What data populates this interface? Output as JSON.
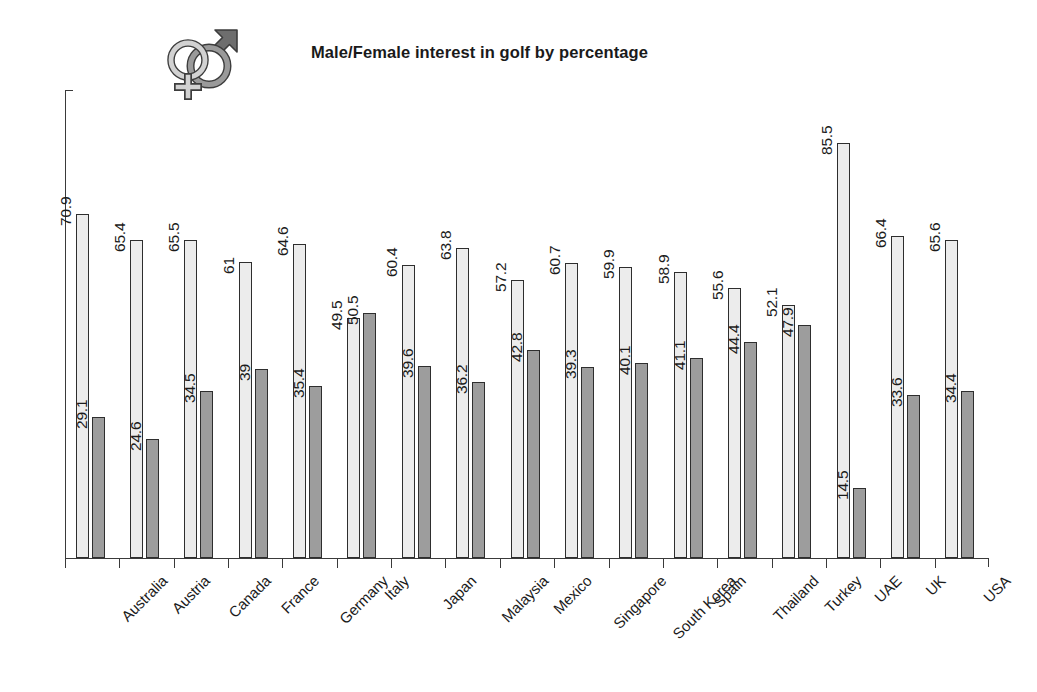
{
  "header": {
    "title": "Male/Female interest in golf by percentage",
    "icon": "male-female-gender-symbol-icon"
  },
  "chart_data": {
    "type": "bar",
    "title": "Male/Female interest in golf by percentage",
    "xlabel": "",
    "ylabel": "",
    "ylim": [
      0,
      90
    ],
    "grid": false,
    "legend": "none",
    "axis_tick_labels_y": [],
    "categories": [
      "Australia",
      "Austria",
      "Canada",
      "France",
      "Germany",
      "Italy",
      "Japan",
      "Malaysia",
      "Mexico",
      "Singapore",
      "South Korea",
      "Spain",
      "Thailand",
      "Turkey",
      "UAE",
      "UK",
      "USA"
    ],
    "series": [
      {
        "name": "Male",
        "color": "#ececec",
        "values": [
          70.9,
          65.4,
          65.5,
          61,
          64.6,
          49.5,
          60.4,
          63.8,
          57.2,
          60.7,
          59.9,
          58.9,
          55.6,
          52.1,
          85.5,
          66.4,
          65.6
        ],
        "labels": [
          "70.9",
          "65.4",
          "65.5",
          "61",
          "64.6",
          "49.5",
          "60.4",
          "63.8",
          "57.2",
          "60.7",
          "59.9",
          "58.9",
          "55.6",
          "52.1",
          "85.5",
          "66.4",
          "65.6"
        ]
      },
      {
        "name": "Female",
        "color": "#9d9d9d",
        "values": [
          29.1,
          24.6,
          34.5,
          39,
          35.4,
          50.5,
          39.6,
          36.2,
          42.8,
          39.3,
          40.1,
          41.1,
          44.4,
          47.9,
          14.5,
          33.6,
          34.4
        ],
        "labels": [
          "29.1",
          "24.6",
          "34.5",
          "39",
          "35.4",
          "50.5",
          "39.6",
          "36.2",
          "42.8",
          "39.3",
          "40.1",
          "41.1",
          "44.4",
          "47.9",
          "14.5",
          "33.6",
          "34.4"
        ]
      }
    ]
  },
  "colors": {
    "male_bar": "#ececec",
    "female_bar": "#9d9d9d",
    "bar_outline": "#2e2e2e",
    "axis": "#3a3a3a",
    "text": "#1b1b1b",
    "background": "#ffffff"
  }
}
